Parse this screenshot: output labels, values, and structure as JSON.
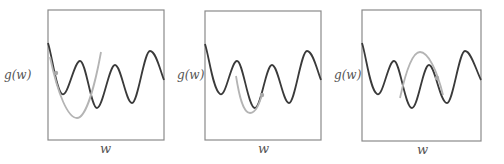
{
  "figure": {
    "panels": [
      {
        "id": "panel-1",
        "ylabel": "g(w)",
        "xlabel": "w",
        "box": {
          "x": 48,
          "y": 10,
          "w": 116,
          "h": 130
        },
        "ylabel_pos": {
          "x": 4,
          "y": 68
        },
        "xlabel_pos": {
          "x": 100,
          "y": 141
        },
        "cost_curve": "M48,43 C52,55 56,90 62,94 C68,98 74,61 80,61 C86,61 91,108 97,108 C103,108 109,65 115,65 C121,65 126,103 132,103 C138,103 144,51 150,51 C156,51 160,70 164,80",
        "approx_curve": "M50,57 C58,95 68,118 77,118 C86,118 95,85 101,52",
        "point": {
          "x": 56,
          "y": 73
        }
      },
      {
        "id": "panel-2",
        "ylabel": "g(w)",
        "xlabel": "w",
        "box": {
          "x": 205,
          "y": 11,
          "w": 116,
          "h": 129
        },
        "ylabel_pos": {
          "x": 177,
          "y": 68
        },
        "xlabel_pos": {
          "x": 258,
          "y": 141
        },
        "cost_curve": "M205,44 C209,56 213,90 220,94 C226,98 231,61 237,61 C243,61 248,108 255,108 C261,108 266,65 272,65 C278,65 283,103 289,103 C295,103 301,51 307,51 C313,51 317,70 321,80",
        "approx_curve": "M236,76 C239,95 243,113 250,113 C256,113 259,104 262,95",
        "point": {
          "x": 262,
          "y": 95
        }
      },
      {
        "id": "panel-3",
        "ylabel": "g(w)",
        "xlabel": "w",
        "box": {
          "x": 362,
          "y": 10,
          "w": 119,
          "h": 131
        },
        "ylabel_pos": {
          "x": 334,
          "y": 68
        },
        "xlabel_pos": {
          "x": 417,
          "y": 142
        },
        "cost_curve": "M362,43 C366,55 370,90 377,94 C383,98 388,61 394,61 C400,61 405,108 412,108 C418,108 423,65 429,65 C435,65 440,103 447,103 C453,103 459,51 465,51 C471,51 476,70 481,80",
        "approx_curve": "M400,98 C405,75 412,52 420,52 C428,52 437,70 443,95",
        "point": {
          "x": 437,
          "y": 78
        }
      }
    ],
    "colors": {
      "frame": "#8a8a8a",
      "cost_curve": "#3a3a3a",
      "approx_curve": "#b4b4b4",
      "point": "#a8a8a8"
    }
  }
}
